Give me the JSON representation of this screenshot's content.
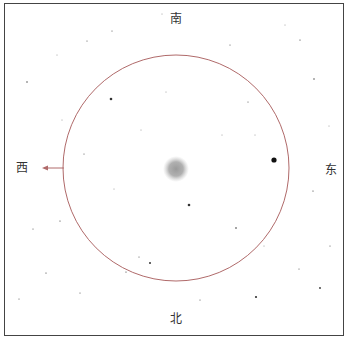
{
  "directions": {
    "south": "南",
    "north": "北",
    "east": "东",
    "west": "西"
  },
  "colors": {
    "frame": "#444444",
    "circle": "#b06a6a",
    "arrow": "#b06a6a",
    "star": "#333333",
    "nebula": "#999999"
  },
  "circle": {
    "cx": 176,
    "cy": 168,
    "r": 113
  },
  "nebula": {
    "cx": 176,
    "cy": 169,
    "r": 12
  },
  "stars": [
    {
      "x": 274,
      "y": 160,
      "r": 2.6
    },
    {
      "x": 111,
      "y": 99,
      "r": 1.3
    },
    {
      "x": 189,
      "y": 205,
      "r": 1.3
    },
    {
      "x": 256,
      "y": 297,
      "r": 1.1
    },
    {
      "x": 150,
      "y": 263,
      "r": 1.0
    },
    {
      "x": 320,
      "y": 288,
      "r": 0.9
    },
    {
      "x": 27,
      "y": 82,
      "r": 0.7
    },
    {
      "x": 236,
      "y": 228,
      "r": 0.8
    },
    {
      "x": 314,
      "y": 79,
      "r": 0.7
    },
    {
      "x": 300,
      "y": 40,
      "r": 0.6
    },
    {
      "x": 126,
      "y": 272,
      "r": 0.6
    },
    {
      "x": 46,
      "y": 273,
      "r": 0.6
    },
    {
      "x": 60,
      "y": 221,
      "r": 0.6
    },
    {
      "x": 313,
      "y": 191,
      "r": 0.6
    },
    {
      "x": 230,
      "y": 45,
      "r": 0.5
    },
    {
      "x": 112,
      "y": 31,
      "r": 0.5
    },
    {
      "x": 87,
      "y": 41,
      "r": 0.5
    },
    {
      "x": 80,
      "y": 293,
      "r": 0.5
    },
    {
      "x": 139,
      "y": 257,
      "r": 0.5
    },
    {
      "x": 33,
      "y": 229,
      "r": 0.5
    },
    {
      "x": 200,
      "y": 300,
      "r": 0.5
    },
    {
      "x": 330,
      "y": 246,
      "r": 0.5
    },
    {
      "x": 299,
      "y": 269,
      "r": 0.5
    },
    {
      "x": 84,
      "y": 154,
      "r": 0.5
    },
    {
      "x": 19,
      "y": 299,
      "r": 0.5
    },
    {
      "x": 248,
      "y": 102,
      "r": 0.5
    },
    {
      "x": 222,
      "y": 135,
      "r": 0.4
    },
    {
      "x": 255,
      "y": 135,
      "r": 0.4
    },
    {
      "x": 166,
      "y": 92,
      "r": 0.4
    },
    {
      "x": 141,
      "y": 130,
      "r": 0.4
    },
    {
      "x": 114,
      "y": 189,
      "r": 0.4
    },
    {
      "x": 264,
      "y": 246,
      "r": 0.4
    },
    {
      "x": 62,
      "y": 120,
      "r": 0.4
    },
    {
      "x": 57,
      "y": 55,
      "r": 0.4
    },
    {
      "x": 162,
      "y": 14,
      "r": 0.4
    },
    {
      "x": 329,
      "y": 126,
      "r": 0.4
    },
    {
      "x": 285,
      "y": 25,
      "r": 0.4
    }
  ]
}
